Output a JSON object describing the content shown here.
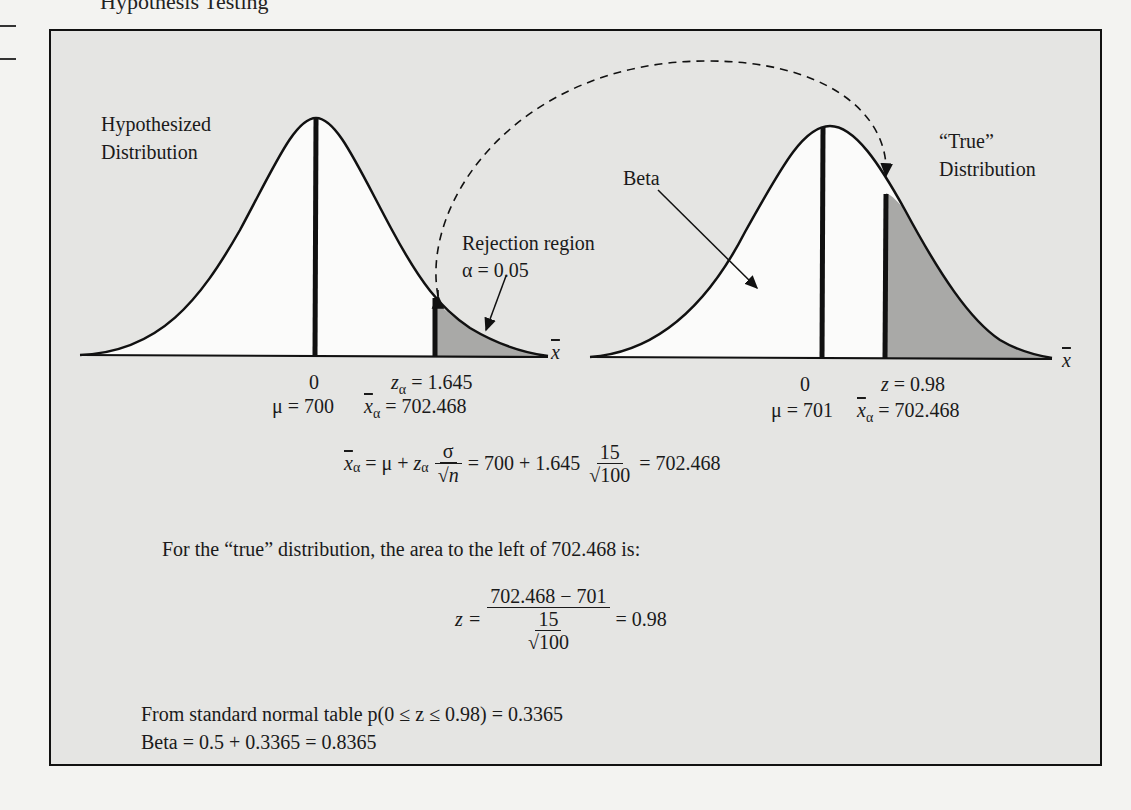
{
  "page": {
    "header_text": "Hypothesis Testing"
  },
  "figure": {
    "hypothesized": {
      "title_line1": "Hypothesized",
      "title_line2": "Distribution",
      "zero_label": "0",
      "mu_label": "μ = 700",
      "z_alpha_label": "= 1.645",
      "xbar_alpha_label": "= 702.468",
      "rejection_line1": "Rejection region",
      "rejection_line2": "α = 0.05",
      "axis_label": "x"
    },
    "true": {
      "title_line1": "“True”",
      "title_line2": "Distribution",
      "beta_label": "Beta",
      "zero_label": "0",
      "mu_label": "μ = 701",
      "z_label": "= 0.98",
      "xbar_alpha_label": "= 702.468",
      "axis_label": "x"
    },
    "colors": {
      "frame_bg": "#e5e5e3",
      "curve_fill": "#fbfbfa",
      "shade": "#a9a9a7",
      "ink": "#111111"
    }
  },
  "calculations": {
    "eq1": {
      "lhs_sub": "α",
      "eq_mu": "= μ +",
      "z_sub": "α",
      "sigma": "σ",
      "sqrt_n": "√n",
      "mid": "= 700 + 1.645",
      "num": "15",
      "den": "√100",
      "result": "= 702.468"
    },
    "sentence": "For the “true” distribution, the area to the left of 702.468 is:",
    "eq2": {
      "lhs": "z =",
      "num": "702.468 − 701",
      "den_num": "15",
      "den_den": "√100",
      "result": "= 0.98"
    },
    "table_line": "From standard normal table p(0 ≤ z ≤ 0.98) = 0.3365",
    "beta_line": "Beta = 0.5 + 0.3365 = 0.8365"
  }
}
